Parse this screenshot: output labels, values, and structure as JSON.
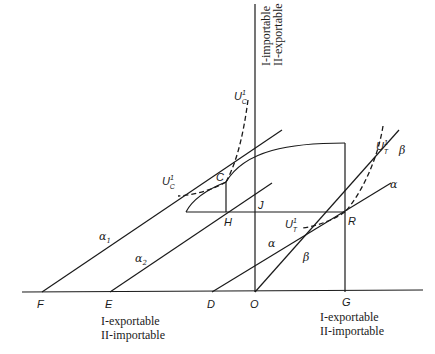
{
  "axes": {
    "top_label_line1": "I-importable",
    "top_label_line2": "II-exportable",
    "bottom_left_line1": "I-exportable",
    "bottom_left_line2": "II-importable",
    "bottom_right_line1": "I-exportable",
    "bottom_right_line2": "II-importable"
  },
  "points": {
    "F": "F",
    "E": "E",
    "D": "D",
    "O": "O",
    "G": "G",
    "C": "C",
    "H": "H",
    "J": "J",
    "R": "R"
  },
  "lines": {
    "alpha1": "α",
    "alpha1_sub": "1",
    "alpha2": "α",
    "alpha2_sub": "2",
    "alpha": "α",
    "alpha_right": "α",
    "beta": "β",
    "beta_right": "β"
  },
  "curves": {
    "UC_top": "U",
    "UC_top_sub": "C",
    "UC_top_sup": "1",
    "UC_left": "U",
    "UC_left_sub": "C",
    "UC_left_sup": "1",
    "UT_top": "U",
    "UT_top_sub": "T",
    "UT_top_sup": "1",
    "UT_left": "U",
    "UT_left_sub": "T",
    "UT_left_sup": "1"
  }
}
